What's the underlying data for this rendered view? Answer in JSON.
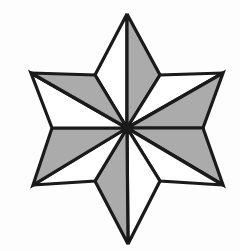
{
  "figure": {
    "name": "six-pointed-star",
    "background_color": "#fdfdfd",
    "stroke_color": "#1a1a1a",
    "fill_shaded": "#ababab",
    "fill_plain": "#ffffff",
    "stroke_width": 3.2,
    "center": {
      "x": 127,
      "y": 128
    },
    "point_count": 6,
    "segment_count": 12,
    "outer_points": [
      {
        "name": "top",
        "x": 127,
        "y": 14,
        "angle_deg": 90
      },
      {
        "name": "upper-right",
        "x": 223,
        "y": 73,
        "angle_deg": 30
      },
      {
        "name": "lower-right",
        "x": 223,
        "y": 185,
        "angle_deg": -30
      },
      {
        "name": "bottom",
        "x": 128,
        "y": 244,
        "angle_deg": -90
      },
      {
        "name": "lower-left",
        "x": 33,
        "y": 185,
        "angle_deg": -150
      },
      {
        "name": "upper-left",
        "x": 31,
        "y": 73,
        "angle_deg": 150
      }
    ],
    "inner_points": [
      {
        "name": "inner-upper-right",
        "x": 160,
        "y": 75,
        "angle_deg": 60
      },
      {
        "name": "inner-right",
        "x": 203,
        "y": 128,
        "angle_deg": 0
      },
      {
        "name": "inner-lower-right",
        "x": 160,
        "y": 181,
        "angle_deg": -60
      },
      {
        "name": "inner-lower-left",
        "x": 95,
        "y": 181,
        "angle_deg": -120
      },
      {
        "name": "inner-left",
        "x": 52,
        "y": 128,
        "angle_deg": 180
      },
      {
        "name": "inner-upper-left",
        "x": 95,
        "y": 75,
        "angle_deg": 120
      }
    ],
    "segments": [
      {
        "id": "seg-01",
        "label": "top-left-half",
        "outer": "top",
        "inner": "inner-upper-left",
        "fill": "plain"
      },
      {
        "id": "seg-02",
        "label": "top-right-half",
        "outer": "top",
        "inner": "inner-upper-right",
        "fill": "shaded"
      },
      {
        "id": "seg-03",
        "label": "upper-right-upper-half",
        "outer": "upper-right",
        "inner": "inner-upper-right",
        "fill": "plain"
      },
      {
        "id": "seg-04",
        "label": "upper-right-lower-half",
        "outer": "upper-right",
        "inner": "inner-right",
        "fill": "shaded"
      },
      {
        "id": "seg-05",
        "label": "lower-right-upper-half",
        "outer": "lower-right",
        "inner": "inner-right",
        "fill": "shaded"
      },
      {
        "id": "seg-06",
        "label": "lower-right-lower-half",
        "outer": "lower-right",
        "inner": "inner-lower-right",
        "fill": "plain"
      },
      {
        "id": "seg-07",
        "label": "bottom-right-half",
        "outer": "bottom",
        "inner": "inner-lower-right",
        "fill": "plain"
      },
      {
        "id": "seg-08",
        "label": "bottom-left-half",
        "outer": "bottom",
        "inner": "inner-lower-left",
        "fill": "shaded"
      },
      {
        "id": "seg-09",
        "label": "lower-left-lower-half",
        "outer": "lower-left",
        "inner": "inner-lower-left",
        "fill": "plain"
      },
      {
        "id": "seg-10",
        "label": "lower-left-upper-half",
        "outer": "lower-left",
        "inner": "inner-left",
        "fill": "shaded"
      },
      {
        "id": "seg-11",
        "label": "upper-left-lower-half",
        "outer": "upper-left",
        "inner": "inner-left",
        "fill": "plain"
      },
      {
        "id": "seg-12",
        "label": "upper-left-upper-half",
        "outer": "upper-left",
        "inner": "inner-upper-left",
        "fill": "shaded"
      }
    ]
  }
}
